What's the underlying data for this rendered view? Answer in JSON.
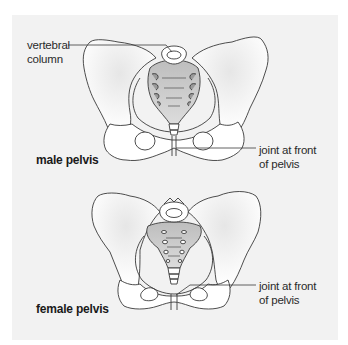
{
  "diagram": {
    "panel_color": "#f2f2f2",
    "outline_color": "#3a3a3a",
    "bone_fill": "#ffffff",
    "sacrum_shade": "#c8c8c8",
    "male": {
      "title": "male pelvis",
      "labels": {
        "vertebral_line1": "vertebral",
        "vertebral_line2": "column",
        "joint_line1": "joint at front",
        "joint_line2": "of pelvis"
      }
    },
    "female": {
      "title": "female pelvis",
      "labels": {
        "joint_line1": "joint at front",
        "joint_line2": "of pelvis"
      }
    }
  }
}
